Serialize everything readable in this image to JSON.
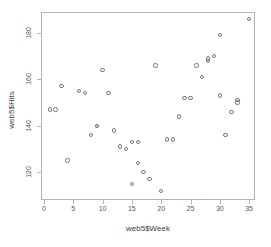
{
  "chart_data": {
    "type": "scatter",
    "title": "",
    "xlabel": "web5$Week",
    "ylabel": "web5$Hits",
    "grid": false,
    "legend": null,
    "xlim": [
      -0.5,
      36.0
    ],
    "ylim": [
      108.0,
      189.0
    ],
    "xticks": [
      0,
      5,
      10,
      15,
      20,
      25,
      30,
      35
    ],
    "xticklabels": [
      "0",
      "5",
      "10",
      "15",
      "20",
      "25",
      "30",
      "35"
    ],
    "yticks": [
      120,
      140,
      160,
      180
    ],
    "yticklabels": [
      "120",
      "140",
      "160",
      "180"
    ],
    "marker": "open-circle",
    "marker_color": "#7a7a7a",
    "x": [
      1,
      2,
      3,
      4,
      6,
      7,
      8,
      9,
      9,
      10,
      11,
      12,
      13,
      14,
      15,
      15,
      16,
      16,
      17,
      18,
      19,
      20,
      21,
      22,
      23,
      24,
      25,
      26,
      27,
      28,
      28,
      29,
      30,
      30,
      31,
      32,
      33,
      33,
      35
    ],
    "y": [
      147,
      147,
      157,
      125,
      155,
      154,
      136,
      140,
      140,
      164,
      154,
      138,
      131,
      130,
      133,
      115,
      124,
      133,
      120,
      117,
      166,
      112,
      134,
      134,
      144,
      152,
      152,
      166,
      161,
      168,
      169,
      170,
      179,
      153,
      136,
      146,
      151,
      150,
      186
    ],
    "points": [
      {
        "x": 1,
        "y": 147
      },
      {
        "x": 2,
        "y": 147
      },
      {
        "x": 3,
        "y": 157
      },
      {
        "x": 4,
        "y": 125
      },
      {
        "x": 6,
        "y": 155
      },
      {
        "x": 7,
        "y": 154
      },
      {
        "x": 8,
        "y": 136
      },
      {
        "x": 9,
        "y": 140
      },
      {
        "x": 9,
        "y": 140
      },
      {
        "x": 10,
        "y": 164
      },
      {
        "x": 11,
        "y": 154
      },
      {
        "x": 12,
        "y": 138
      },
      {
        "x": 13,
        "y": 131
      },
      {
        "x": 14,
        "y": 130
      },
      {
        "x": 15,
        "y": 133
      },
      {
        "x": 15,
        "y": 115
      },
      {
        "x": 16,
        "y": 124
      },
      {
        "x": 16,
        "y": 133
      },
      {
        "x": 17,
        "y": 120
      },
      {
        "x": 18,
        "y": 117
      },
      {
        "x": 19,
        "y": 166
      },
      {
        "x": 20,
        "y": 112
      },
      {
        "x": 21,
        "y": 134
      },
      {
        "x": 22,
        "y": 134
      },
      {
        "x": 23,
        "y": 144
      },
      {
        "x": 24,
        "y": 152
      },
      {
        "x": 25,
        "y": 152
      },
      {
        "x": 26,
        "y": 166
      },
      {
        "x": 27,
        "y": 161
      },
      {
        "x": 28,
        "y": 168
      },
      {
        "x": 28,
        "y": 169
      },
      {
        "x": 29,
        "y": 170
      },
      {
        "x": 30,
        "y": 179
      },
      {
        "x": 30,
        "y": 153
      },
      {
        "x": 31,
        "y": 136
      },
      {
        "x": 32,
        "y": 146
      },
      {
        "x": 33,
        "y": 151
      },
      {
        "x": 33,
        "y": 150
      },
      {
        "x": 35,
        "y": 186
      }
    ]
  }
}
